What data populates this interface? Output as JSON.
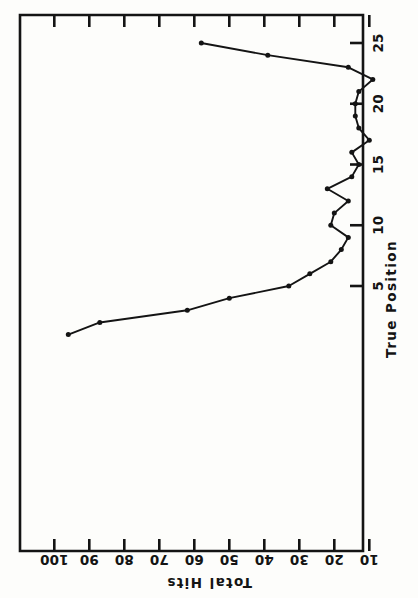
{
  "figure": {
    "width": 418,
    "height": 598,
    "background": "#fdfdfb",
    "ink_color": "#141414",
    "rotation_note": "rotated-90"
  },
  "chart_data": {
    "type": "line",
    "title": "",
    "xlabel": "True Position",
    "ylabel": "Total Hits",
    "xlim": [
      0,
      26
    ],
    "ylim": [
      0,
      105
    ],
    "xticks": [
      5,
      10,
      15,
      20,
      25
    ],
    "yticks": [
      10,
      20,
      30,
      40,
      50,
      60,
      70,
      80,
      90,
      100
    ],
    "grid": false,
    "legend": null,
    "marker": "filled-circle",
    "x": [
      1,
      2,
      3,
      4,
      5,
      6,
      7,
      8,
      9,
      10,
      11,
      12,
      13,
      14,
      15,
      16,
      17,
      18,
      19,
      20,
      21,
      22,
      23,
      24,
      25
    ],
    "y": [
      96,
      87,
      62,
      50,
      33,
      27,
      21,
      18,
      16,
      21,
      20,
      16,
      22,
      15,
      13,
      15,
      10,
      13,
      14,
      14,
      13,
      9,
      16,
      39,
      58
    ],
    "series": [
      {
        "name": "Total Hits",
        "x": [
          1,
          2,
          3,
          4,
          5,
          6,
          7,
          8,
          9,
          10,
          11,
          12,
          13,
          14,
          15,
          16,
          17,
          18,
          19,
          20,
          21,
          22,
          23,
          24,
          25
        ],
        "values": [
          96,
          87,
          62,
          50,
          33,
          27,
          21,
          18,
          16,
          21,
          20,
          16,
          22,
          15,
          13,
          15,
          10,
          13,
          14,
          14,
          13,
          9,
          16,
          39,
          58
        ]
      }
    ]
  },
  "axes": {
    "x_axis": {
      "title": "True Position",
      "tick_labels": [
        "5",
        "10",
        "15",
        "20",
        "25"
      ],
      "tick_values": [
        5,
        10,
        15,
        20,
        25
      ]
    },
    "y_axis": {
      "title": "Total Hits",
      "tick_labels": [
        "100",
        "90",
        "80",
        "70",
        "60",
        "50",
        "40",
        "30",
        "20",
        "10"
      ],
      "tick_values": [
        100,
        90,
        80,
        70,
        60,
        50,
        40,
        30,
        20,
        10
      ]
    }
  }
}
